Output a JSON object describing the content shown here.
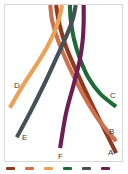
{
  "chart_data": {
    "type": "line",
    "title": "",
    "xlabel": "",
    "ylabel": "",
    "xlim": [
      0,
      119
    ],
    "ylim": [
      0,
      158
    ],
    "grid": false,
    "legend_position": "bottom",
    "background": "#ffffff",
    "frame_color": "#d8d8d8",
    "series": [
      {
        "name": "A",
        "label": "A",
        "color": "#8c3b1e",
        "label_x": 103,
        "label_y": 148,
        "start": [
          52,
          0
        ],
        "points": [
          [
            52,
            0
          ],
          [
            55,
            18
          ],
          [
            62,
            42
          ],
          [
            74,
            70
          ],
          [
            88,
            100
          ],
          [
            102,
            128
          ],
          [
            113,
            150
          ]
        ],
        "end": [
          113,
          150
        ]
      },
      {
        "name": "B",
        "label": "B",
        "color": "#cd7050",
        "label_x": 104,
        "label_y": 127,
        "start": [
          46,
          0
        ],
        "points": [
          [
            46,
            0
          ],
          [
            48,
            16
          ],
          [
            54,
            36
          ],
          [
            64,
            60
          ],
          [
            78,
            88
          ],
          [
            95,
            116
          ],
          [
            113,
            138
          ]
        ],
        "end": [
          113,
          138
        ]
      },
      {
        "name": "C",
        "label": "C",
        "color": "#1f6b38",
        "label_x": 105,
        "label_y": 91,
        "start": [
          66,
          0
        ],
        "points": [
          [
            66,
            0
          ],
          [
            67,
            16
          ],
          [
            70,
            34
          ],
          [
            76,
            54
          ],
          [
            85,
            74
          ],
          [
            97,
            90
          ],
          [
            113,
            103
          ]
        ],
        "end": [
          113,
          103
        ]
      },
      {
        "name": "D",
        "label": "D",
        "color": "#eda156",
        "label_x": 9,
        "label_y": 81,
        "start": [
          58,
          0
        ],
        "points": [
          [
            58,
            0
          ],
          [
            55,
            14
          ],
          [
            50,
            28
          ],
          [
            42,
            44
          ],
          [
            31,
            62
          ],
          [
            18,
            82
          ],
          [
            5,
            104
          ]
        ],
        "end": [
          5,
          104
        ]
      },
      {
        "name": "E",
        "label": "E",
        "color": "#465055",
        "label_x": 17,
        "label_y": 133,
        "start": [
          72,
          0
        ],
        "points": [
          [
            72,
            0
          ],
          [
            69,
            14
          ],
          [
            63,
            30
          ],
          [
            53,
            52
          ],
          [
            41,
            78
          ],
          [
            26,
            108
          ],
          [
            12,
            134
          ]
        ],
        "end": [
          12,
          134
        ]
      },
      {
        "name": "F",
        "label": "F",
        "color": "#6e1f52",
        "label_x": 53,
        "label_y": 152,
        "start": [
          80,
          0
        ],
        "points": [
          [
            80,
            0
          ],
          [
            80,
            18
          ],
          [
            79,
            36
          ],
          [
            76,
            56
          ],
          [
            70,
            80
          ],
          [
            62,
            110
          ],
          [
            56,
            145
          ]
        ],
        "end": [
          56,
          145
        ]
      }
    ],
    "endpoint_labels": [
      "A",
      "B",
      "C",
      "D",
      "E",
      "F"
    ],
    "legend": {
      "clipped": true,
      "items": [
        {
          "label": "",
          "color": "#8c3b1e"
        },
        {
          "label": "",
          "color": "#cd7050"
        },
        {
          "label": "",
          "color": "#eda156"
        },
        {
          "label": "",
          "color": "#1f6b38"
        },
        {
          "label": "",
          "color": "#465055"
        },
        {
          "label": "",
          "color": "#6e1f52"
        }
      ]
    }
  }
}
